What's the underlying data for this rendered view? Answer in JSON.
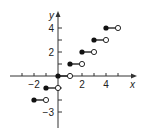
{
  "chart_data": {
    "type": "step",
    "title": "",
    "xlabel": "x",
    "ylabel": "y",
    "xlim": [
      -4,
      6
    ],
    "ylim": [
      -4,
      5
    ],
    "x_tick_labels": [
      "-2",
      "2",
      "4"
    ],
    "y_tick_labels": [
      "4",
      "2",
      "-3"
    ],
    "x_ticks": [
      -3,
      -2,
      -1,
      1,
      2,
      3,
      4,
      5
    ],
    "y_ticks": [
      -3,
      -2,
      -1,
      1,
      2,
      3,
      4
    ],
    "grid": false,
    "function": "floor(x)",
    "segments": [
      {
        "x_start": -2,
        "x_end": -1,
        "y": -2,
        "start_closed": true,
        "end_closed": false
      },
      {
        "x_start": -1,
        "x_end": 0,
        "y": -1,
        "start_closed": true,
        "end_closed": false
      },
      {
        "x_start": 0,
        "x_end": 1,
        "y": 0,
        "start_closed": true,
        "end_closed": false
      },
      {
        "x_start": 1,
        "x_end": 2,
        "y": 1,
        "start_closed": true,
        "end_closed": false
      },
      {
        "x_start": 2,
        "x_end": 3,
        "y": 2,
        "start_closed": true,
        "end_closed": false
      },
      {
        "x_start": 3,
        "x_end": 4,
        "y": 3,
        "start_closed": true,
        "end_closed": false
      },
      {
        "x_start": 4,
        "x_end": 5,
        "y": 4,
        "start_closed": true,
        "end_closed": false
      }
    ]
  },
  "layout": {
    "origin_px": [
      58,
      76
    ],
    "unit_px": 12,
    "x_axis_px": [
      10,
      137
    ],
    "y_axis_px": [
      11,
      128
    ],
    "colors": {
      "axis": "#333333",
      "point": "#111111",
      "open_fill": "#ffffff"
    }
  }
}
